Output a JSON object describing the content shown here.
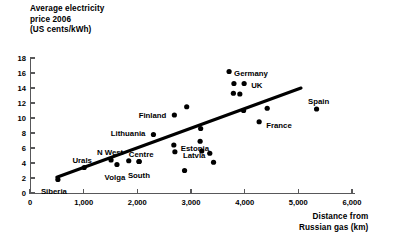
{
  "chart_data": {
    "type": "scatter",
    "title": "Average electricity price 2006 (US cents/kWh)",
    "title_lines": [
      "Average electricity",
      "price 2006",
      "(US cents/kWh)"
    ],
    "xlabel": "Distance from Russian gas (km)",
    "xlabel_lines": [
      "Distance from",
      "Russian gas (km)"
    ],
    "ylabel": "Average electricity price 2006 (US cents/kWh)",
    "xlim": [
      0,
      6000
    ],
    "ylim": [
      0,
      18
    ],
    "grid": false,
    "legend": "none",
    "xticks": [
      0,
      1000,
      2000,
      3000,
      4000,
      5000,
      6000
    ],
    "xticklabels": [
      "0",
      "1,000",
      "2,000",
      "3,000",
      "4,000",
      "5,000",
      "6,000"
    ],
    "yticks": [
      0,
      2,
      4,
      6,
      8,
      10,
      12,
      14,
      16,
      18
    ],
    "yticklabels": [
      "0",
      "2",
      "4",
      "6",
      "8",
      "10",
      "12",
      "14",
      "16",
      "18"
    ],
    "trendline": {
      "x": [
        500,
        5050
      ],
      "y": [
        2.1,
        14.0
      ]
    },
    "points": [
      {
        "label": "Siberia",
        "x": 520,
        "y": 1.8,
        "label_dx": -4,
        "label_dy": 12,
        "anchor": "middle"
      },
      {
        "label": "Urals",
        "x": 1010,
        "y": 3.4,
        "label_dx": -2,
        "label_dy": -7,
        "anchor": "middle"
      },
      {
        "label": "N West",
        "x": 1510,
        "y": 4.4,
        "label_dx": -1,
        "label_dy": -8,
        "anchor": "middle"
      },
      {
        "label": "Volga",
        "x": 1620,
        "y": 3.8,
        "label_dx": -2,
        "label_dy": 13,
        "anchor": "middle"
      },
      {
        "label": "",
        "x": 1840,
        "y": 4.3,
        "label_dx": 0,
        "label_dy": 0,
        "anchor": "middle"
      },
      {
        "label": "South",
        "x": 2030,
        "y": 4.2,
        "label_dx": 0,
        "label_dy": 14,
        "anchor": "middle"
      },
      {
        "label": "Centre",
        "x": 2035,
        "y": 4.2,
        "label_dx": 2,
        "label_dy": -7,
        "anchor": "middle"
      },
      {
        "label": "Lithuania",
        "x": 2300,
        "y": 7.8,
        "label_dx": -8,
        "label_dy": -1,
        "anchor": "end"
      },
      {
        "label": "Estonia",
        "x": 2680,
        "y": 6.4,
        "label_dx": 7,
        "label_dy": 3,
        "anchor": "start"
      },
      {
        "label": "Latvia",
        "x": 2700,
        "y": 5.5,
        "label_dx": 8,
        "label_dy": 3,
        "anchor": "start"
      },
      {
        "label": "Finland",
        "x": 2690,
        "y": 10.4,
        "label_dx": -8,
        "label_dy": 0,
        "anchor": "end"
      },
      {
        "label": "",
        "x": 2920,
        "y": 11.5,
        "label_dx": 0,
        "label_dy": 0,
        "anchor": "middle"
      },
      {
        "label": "",
        "x": 2880,
        "y": 3.0,
        "label_dx": 0,
        "label_dy": 0,
        "anchor": "middle"
      },
      {
        "label": "",
        "x": 3180,
        "y": 8.6,
        "label_dx": 0,
        "label_dy": 0,
        "anchor": "middle"
      },
      {
        "label": "",
        "x": 3170,
        "y": 6.9,
        "label_dx": 0,
        "label_dy": 0,
        "anchor": "middle"
      },
      {
        "label": "",
        "x": 3200,
        "y": 5.6,
        "label_dx": 0,
        "label_dy": 0,
        "anchor": "middle"
      },
      {
        "label": "",
        "x": 3350,
        "y": 5.3,
        "label_dx": 0,
        "label_dy": 0,
        "anchor": "middle"
      },
      {
        "label": "",
        "x": 3420,
        "y": 4.1,
        "label_dx": 0,
        "label_dy": 0,
        "anchor": "middle"
      },
      {
        "label": "Germany",
        "x": 3710,
        "y": 16.2,
        "label_dx": 5,
        "label_dy": 2,
        "anchor": "start"
      },
      {
        "label": "",
        "x": 3800,
        "y": 14.6,
        "label_dx": 0,
        "label_dy": 0,
        "anchor": "middle"
      },
      {
        "label": "",
        "x": 3790,
        "y": 13.3,
        "label_dx": 0,
        "label_dy": 0,
        "anchor": "middle"
      },
      {
        "label": "",
        "x": 3910,
        "y": 13.2,
        "label_dx": 0,
        "label_dy": 0,
        "anchor": "middle"
      },
      {
        "label": "UK",
        "x": 3990,
        "y": 14.6,
        "label_dx": 7,
        "label_dy": 2,
        "anchor": "start"
      },
      {
        "label": "",
        "x": 3980,
        "y": 11.0,
        "label_dx": 0,
        "label_dy": 0,
        "anchor": "middle"
      },
      {
        "label": "France",
        "x": 4270,
        "y": 9.5,
        "label_dx": 7,
        "label_dy": 3,
        "anchor": "start"
      },
      {
        "label": "",
        "x": 4420,
        "y": 11.3,
        "label_dx": 0,
        "label_dy": 0,
        "anchor": "middle"
      },
      {
        "label": "Spain",
        "x": 5340,
        "y": 11.2,
        "label_dx": 2,
        "label_dy": -8,
        "anchor": "middle"
      }
    ]
  },
  "colors": {
    "dot": "#000000",
    "trendline": "#000000",
    "axis": "#58585a",
    "text": "#000000",
    "background": "#ffffff"
  }
}
